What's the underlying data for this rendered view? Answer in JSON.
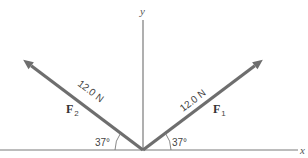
{
  "axes": {
    "x_label": "x",
    "y_label": "y"
  },
  "vectors": [
    {
      "id": "F1",
      "symbol": "F",
      "subscript": "1",
      "magnitude_label": "12.0 N",
      "magnitude": 12.0,
      "unit": "N",
      "angle_deg": 37,
      "angle_label": "37°",
      "direction": "up-right, measured from +x axis"
    },
    {
      "id": "F2",
      "symbol": "F",
      "subscript": "2",
      "magnitude_label": "12.0 N",
      "magnitude": 12.0,
      "unit": "N",
      "angle_deg": 37,
      "angle_label": "37°",
      "direction": "up-left, measured from −x axis"
    }
  ],
  "colors": {
    "vector": "#6e6e6e",
    "axis": "#7a7a7a",
    "text": "#444444"
  }
}
